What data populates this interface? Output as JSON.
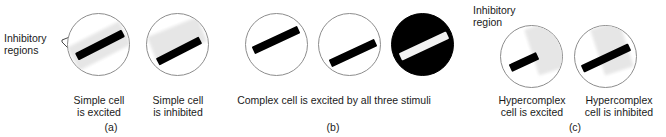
{
  "figure": {
    "background_color": "#ffffff",
    "outline_color": "#8d8d8d",
    "bar_dark_color": "#000000",
    "bar_light_color": "#f2f2f2",
    "inhibitory_color": "#e6e6e6"
  },
  "panel_a": {
    "letter": "(a)",
    "callout_label": "Inhibitory\nregions",
    "stimuli": [
      {
        "name": "simple-cell-excited",
        "caption": "Simple cell\nis excited",
        "circle_type": "outline",
        "bar_color": "#000000",
        "has_inhibitory_region": true
      },
      {
        "name": "simple-cell-inhibited",
        "caption": "Simple cell\nis inhibited",
        "circle_type": "outline",
        "bar_color": "#000000",
        "has_inhibitory_region": true
      }
    ]
  },
  "panel_b": {
    "letter": "(b)",
    "caption": "Complex cell is excited by all three stimuli",
    "stimuli": [
      {
        "name": "complex-stimulus-upper-left",
        "circle_type": "outline",
        "bar_color": "#000000"
      },
      {
        "name": "complex-stimulus-lower-right",
        "circle_type": "outline",
        "bar_color": "#000000"
      },
      {
        "name": "complex-stimulus-inverted",
        "circle_type": "filled",
        "bar_color": "#f2f2f2"
      }
    ]
  },
  "panel_c": {
    "letter": "(c)",
    "callout_label": "Inhibitory\nregion",
    "stimuli": [
      {
        "name": "hypercomplex-cell-excited",
        "caption": "Hypercomplex\ncell is excited",
        "circle_type": "outline",
        "bar_color": "#000000",
        "has_inhibitory_region": true
      },
      {
        "name": "hypercomplex-cell-inhibited",
        "caption": "Hypercomplex\ncell is inhibited",
        "circle_type": "outline",
        "bar_color": "#000000",
        "has_inhibitory_region": true
      }
    ]
  }
}
